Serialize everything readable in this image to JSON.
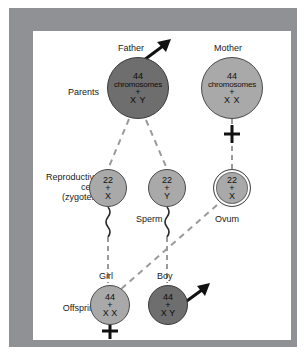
{
  "figure": {
    "frame_color": "#8f9194",
    "background_color": "#ffffff",
    "dark_cell_color": "#6e6e6e",
    "light_cell_color": "#a9a9a9",
    "line_color": "#8a8a8a"
  },
  "row_labels": {
    "parents": "Parents",
    "reproductive_line1": "Reproductive",
    "reproductive_line2": "cells",
    "reproductive_line3": "(zygotes)",
    "offspring": "Offspring"
  },
  "parents": [
    {
      "name": "father",
      "title": "Father",
      "number": "44",
      "unit": "chromosomes",
      "operator": "+",
      "alleles": "X Y",
      "symbol": "male-arrow",
      "shade": "dark"
    },
    {
      "name": "mother",
      "title": "Mother",
      "number": "44",
      "unit": "chromosomes",
      "operator": "+",
      "alleles": "X X",
      "symbol": "female-cross",
      "shade": "light"
    }
  ],
  "gametes": [
    {
      "name": "sperm-x",
      "number": "22",
      "operator": "+",
      "alleles": "X",
      "caption": "",
      "shade": "light"
    },
    {
      "name": "sperm-y",
      "number": "22",
      "operator": "+",
      "alleles": "Y",
      "caption": "Sperm",
      "shade": "light"
    },
    {
      "name": "ovum",
      "number": "22",
      "operator": "+",
      "alleles": "X",
      "caption": "Ovum",
      "shade": "light"
    }
  ],
  "offspring": [
    {
      "name": "girl",
      "title": "Girl",
      "number": "44",
      "operator": "+",
      "alleles": "X X",
      "symbol": "female-cross",
      "shade": "light"
    },
    {
      "name": "boy",
      "title": "Boy",
      "number": "44",
      "operator": "+",
      "alleles": "X Y",
      "symbol": "male-arrow",
      "shade": "dark"
    }
  ]
}
